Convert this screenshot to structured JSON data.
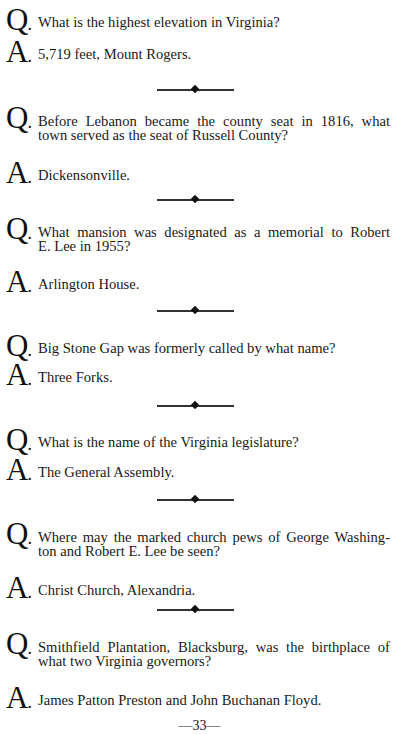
{
  "labels": {
    "q": "Q",
    "a": "A",
    "dot": "."
  },
  "items": [
    {
      "question": [
        "What is the highest elevation in Virginia?"
      ],
      "answer": "5,719 feet, Mount Rogers."
    },
    {
      "question": [
        "Before Lebanon became the county seat in 1816, what",
        "town served as the seat of Russell County?"
      ],
      "answer": "Dickensonville."
    },
    {
      "question": [
        "What mansion was designated as a memorial to Robert",
        "E. Lee in 1955?"
      ],
      "answer": "Arlington House."
    },
    {
      "question": [
        "Big Stone Gap was formerly called by what name?"
      ],
      "answer": "Three Forks."
    },
    {
      "question": [
        "What is the name of the Virginia legislature?"
      ],
      "answer": "The General Assembly."
    },
    {
      "question": [
        "Where may the marked church pews of George Washing-",
        "ton and Robert E. Lee be seen?"
      ],
      "answer": "Christ Church, Alexandria."
    },
    {
      "question": [
        "Smithfield Plantation, Blacksburg, was the birthplace of",
        "what two Virginia governors?"
      ],
      "answer": "James Patton Preston and John Buchanan Floyd."
    }
  ],
  "page_number": "—33—"
}
